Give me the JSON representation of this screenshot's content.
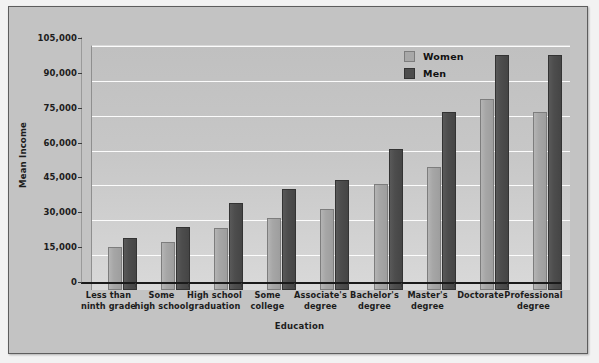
{
  "chart_data": {
    "type": "bar",
    "title": "",
    "xlabel": "Education",
    "ylabel": "Mean Income",
    "ylim": [
      0,
      105000
    ],
    "yticks": [
      "0",
      "15,000",
      "30,000",
      "45,000",
      "60,000",
      "75,000",
      "90,000",
      "105,000"
    ],
    "ytick_values": [
      0,
      15000,
      30000,
      45000,
      60000,
      75000,
      90000,
      105000
    ],
    "grid": true,
    "legend_position": "top-right",
    "categories": [
      "Less than\nninth grade",
      "Some\nhigh school",
      "High school\ngraduation",
      "Some\ncollege",
      "Associate's\ndegree",
      "Bachelor's\ndegree",
      "Master's\ndegree",
      "Doctorate",
      "Professional\ndegree"
    ],
    "category_lines": [
      [
        "Less than",
        "ninth grade"
      ],
      [
        "Some",
        "high school"
      ],
      [
        "High school",
        "graduation"
      ],
      [
        "Some",
        "college"
      ],
      [
        "Associate's",
        "degree"
      ],
      [
        "Bachelor's",
        "degree"
      ],
      [
        "Master's",
        "degree"
      ],
      [
        "Doctorate",
        ""
      ],
      [
        "Professional",
        "degree"
      ]
    ],
    "series": [
      {
        "name": "Women",
        "color": "#a8a8a8",
        "values": [
          18500,
          20500,
          26500,
          31000,
          35000,
          45500,
          53000,
          82000,
          76500
        ]
      },
      {
        "name": "Men",
        "color": "#4d4d4d",
        "values": [
          22500,
          27000,
          37500,
          43500,
          47500,
          60500,
          76500,
          101000,
          101000
        ]
      }
    ]
  },
  "legend": {
    "items": [
      {
        "label": "Women"
      },
      {
        "label": "Men"
      }
    ]
  },
  "axes": {
    "y_title": "Mean Income",
    "x_title": "Education"
  }
}
